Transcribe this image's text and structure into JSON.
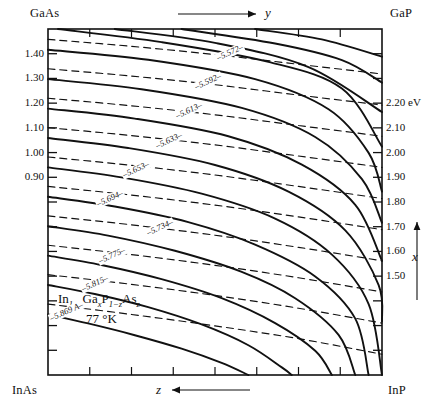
{
  "figure": {
    "title_compound": "In1-xGaxP1-zAsz",
    "temperature": "77 °K",
    "corners": {
      "top_left": "GaAs",
      "top_right": "GaP",
      "bottom_left": "InAs",
      "bottom_right": "InP"
    },
    "axes": {
      "top_variable": "y",
      "bottom_variable": "z",
      "right_variable": "x",
      "left_unit": "",
      "right_unit": "eV"
    },
    "formula_parts": {
      "in": "In",
      "sub1": "1−x",
      "ga": "Ga",
      "sub2": "x",
      "p": "P",
      "sub3": "1−z",
      "as": "As",
      "sub4": "z"
    }
  },
  "left_ticks": [
    "1.40",
    "1.30",
    "1.20",
    "1.10",
    "1.00",
    "0.90"
  ],
  "right_ticks": [
    "2.20 eV",
    "2.10",
    "2.00",
    "1.90",
    "1.80",
    "1.70",
    "1.60",
    "1.50"
  ],
  "lattice_labels": [
    "5.572",
    "5.592",
    "5.613",
    "5.633",
    "5.653",
    "5.694",
    "5.734",
    "5.775",
    "5.815",
    "5.869 A"
  ],
  "chart_data": {
    "type": "line",
    "xlabel": "z  (InAs → InP direction, bottom) / y (GaAs → GaP, top)",
    "ylabel": "x (composition, right axis) / bandgap energy (eV)",
    "xlim": [
      0,
      1
    ],
    "ylim": [
      0,
      1
    ],
    "grid": false,
    "legend": "none",
    "series": [
      {
        "name": "bandgap-0.90eV",
        "style": "solid",
        "label": "0.90",
        "points": [
          [
            0.0,
            0.175
          ],
          [
            0.12,
            0.149
          ],
          [
            0.26,
            0.115
          ],
          [
            0.4,
            0.076
          ],
          [
            0.52,
            0.035
          ],
          [
            0.6,
            0.0
          ]
        ]
      },
      {
        "name": "bandgap-1.00eV",
        "style": "solid",
        "label": "1.00",
        "points": [
          [
            0.0,
            0.26
          ],
          [
            0.14,
            0.234
          ],
          [
            0.3,
            0.196
          ],
          [
            0.46,
            0.146
          ],
          [
            0.6,
            0.086
          ],
          [
            0.7,
            0.022
          ],
          [
            0.73,
            0.0
          ]
        ]
      },
      {
        "name": "bandgap-1.10eV",
        "style": "solid",
        "label": "1.10",
        "points": [
          [
            0.0,
            0.345
          ],
          [
            0.16,
            0.318
          ],
          [
            0.34,
            0.277
          ],
          [
            0.52,
            0.222
          ],
          [
            0.68,
            0.15
          ],
          [
            0.8,
            0.07
          ],
          [
            0.85,
            0.0
          ]
        ]
      },
      {
        "name": "bandgap-1.20eV",
        "style": "solid",
        "label": "1.20",
        "points": [
          [
            0.0,
            0.43
          ],
          [
            0.18,
            0.403
          ],
          [
            0.38,
            0.359
          ],
          [
            0.58,
            0.298
          ],
          [
            0.74,
            0.222
          ],
          [
            0.87,
            0.116
          ],
          [
            0.92,
            0.0
          ]
        ]
      },
      {
        "name": "bandgap-1.30eV",
        "style": "solid",
        "label": "1.30",
        "points": [
          [
            0.0,
            0.515
          ],
          [
            0.2,
            0.487
          ],
          [
            0.42,
            0.442
          ],
          [
            0.62,
            0.377
          ],
          [
            0.8,
            0.285
          ],
          [
            0.92,
            0.163
          ],
          [
            0.96,
            0.0
          ]
        ]
      },
      {
        "name": "bandgap-1.40eV",
        "style": "solid",
        "label": "1.40",
        "points": [
          [
            0.0,
            0.6
          ],
          [
            0.22,
            0.571
          ],
          [
            0.46,
            0.524
          ],
          [
            0.68,
            0.452
          ],
          [
            0.85,
            0.348
          ],
          [
            0.96,
            0.205
          ],
          [
            1.0,
            0.0
          ]
        ]
      },
      {
        "name": "bandgap-1.50eV",
        "style": "solid",
        "label": "1.50",
        "points": [
          [
            0.0,
            0.685
          ],
          [
            0.24,
            0.656
          ],
          [
            0.5,
            0.607
          ],
          [
            0.72,
            0.53
          ],
          [
            0.89,
            0.418
          ],
          [
            0.99,
            0.26
          ],
          [
            1.0,
            0.155
          ]
        ]
      },
      {
        "name": "bandgap-1.60eV",
        "style": "solid",
        "label": "1.60",
        "points": [
          [
            0.0,
            0.77
          ],
          [
            0.26,
            0.741
          ],
          [
            0.54,
            0.69
          ],
          [
            0.76,
            0.608
          ],
          [
            0.92,
            0.492
          ],
          [
            1.0,
            0.33
          ]
        ]
      },
      {
        "name": "bandgap-1.70eV",
        "style": "solid",
        "label": "1.70",
        "points": [
          [
            0.0,
            0.855
          ],
          [
            0.28,
            0.826
          ],
          [
            0.58,
            0.772
          ],
          [
            0.8,
            0.688
          ],
          [
            0.94,
            0.566
          ],
          [
            1.0,
            0.44
          ]
        ]
      },
      {
        "name": "bandgap-1.80eV",
        "style": "solid",
        "label": "1.80",
        "points": [
          [
            0.0,
            0.94
          ],
          [
            0.3,
            0.911
          ],
          [
            0.62,
            0.855
          ],
          [
            0.84,
            0.768
          ],
          [
            0.96,
            0.642
          ],
          [
            1.0,
            0.53
          ]
        ]
      },
      {
        "name": "bandgap-1.90eV",
        "style": "solid",
        "label": "1.90",
        "points": [
          [
            0.03,
            1.0
          ],
          [
            0.34,
            0.962
          ],
          [
            0.66,
            0.905
          ],
          [
            0.88,
            0.828
          ],
          [
            1.0,
            0.66
          ]
        ]
      },
      {
        "name": "bandgap-2.00eV",
        "style": "solid",
        "label": "2.00",
        "points": [
          [
            0.2,
            1.0
          ],
          [
            0.5,
            0.96
          ],
          [
            0.78,
            0.89
          ],
          [
            1.0,
            0.76
          ]
        ]
      },
      {
        "name": "bandgap-2.10eV",
        "style": "solid",
        "label": "2.10",
        "points": [
          [
            0.4,
            1.0
          ],
          [
            0.68,
            0.958
          ],
          [
            0.88,
            0.91
          ],
          [
            1.0,
            0.845
          ]
        ]
      },
      {
        "name": "bandgap-2.20eV",
        "style": "solid",
        "label": "2.20 eV",
        "points": [
          [
            0.62,
            1.0
          ],
          [
            0.82,
            0.97
          ],
          [
            1.0,
            0.92
          ]
        ]
      },
      {
        "name": "lattice-5.869",
        "style": "dashed",
        "label": "5.869 A",
        "points": [
          [
            0.0,
            0.205
          ],
          [
            0.25,
            0.175
          ],
          [
            0.5,
            0.142
          ],
          [
            0.75,
            0.105
          ],
          [
            1.0,
            0.06
          ]
        ]
      },
      {
        "name": "lattice-5.815",
        "style": "dashed",
        "label": "5.815",
        "points": [
          [
            0.0,
            0.29
          ],
          [
            0.25,
            0.262
          ],
          [
            0.5,
            0.23
          ],
          [
            0.75,
            0.193
          ],
          [
            1.0,
            0.15
          ]
        ]
      },
      {
        "name": "lattice-5.775",
        "style": "dashed",
        "label": "5.775",
        "points": [
          [
            0.0,
            0.375
          ],
          [
            0.25,
            0.348
          ],
          [
            0.5,
            0.317
          ],
          [
            0.75,
            0.281
          ],
          [
            1.0,
            0.24
          ]
        ]
      },
      {
        "name": "lattice-5.734",
        "style": "dashed",
        "label": "5.734",
        "points": [
          [
            0.0,
            0.46
          ],
          [
            0.25,
            0.434
          ],
          [
            0.5,
            0.404
          ],
          [
            0.75,
            0.369
          ],
          [
            1.0,
            0.33
          ]
        ]
      },
      {
        "name": "lattice-5.694",
        "style": "dashed",
        "label": "5.694",
        "points": [
          [
            0.0,
            0.545
          ],
          [
            0.25,
            0.52
          ],
          [
            0.5,
            0.491
          ],
          [
            0.75,
            0.457
          ],
          [
            1.0,
            0.42
          ]
        ]
      },
      {
        "name": "lattice-5.653",
        "style": "dashed",
        "label": "5.653",
        "points": [
          [
            0.0,
            0.63
          ],
          [
            0.25,
            0.606
          ],
          [
            0.5,
            0.578
          ],
          [
            0.75,
            0.545
          ],
          [
            1.0,
            0.51
          ]
        ]
      },
      {
        "name": "lattice-5.633",
        "style": "dashed",
        "label": "5.633",
        "points": [
          [
            0.0,
            0.715
          ],
          [
            0.25,
            0.692
          ],
          [
            0.5,
            0.665
          ],
          [
            0.75,
            0.633
          ],
          [
            1.0,
            0.6
          ]
        ]
      },
      {
        "name": "lattice-5.613",
        "style": "dashed",
        "label": "5.613",
        "points": [
          [
            0.0,
            0.8
          ],
          [
            0.25,
            0.778
          ],
          [
            0.5,
            0.752
          ],
          [
            0.75,
            0.721
          ],
          [
            1.0,
            0.69
          ]
        ]
      },
      {
        "name": "lattice-5.592",
        "style": "dashed",
        "label": "5.592",
        "points": [
          [
            0.0,
            0.885
          ],
          [
            0.25,
            0.864
          ],
          [
            0.5,
            0.839
          ],
          [
            0.75,
            0.809
          ],
          [
            1.0,
            0.78
          ]
        ]
      },
      {
        "name": "lattice-5.572",
        "style": "dashed",
        "label": "5.572",
        "points": [
          [
            0.0,
            0.97
          ],
          [
            0.25,
            0.95
          ],
          [
            0.5,
            0.926
          ],
          [
            0.75,
            0.898
          ],
          [
            1.0,
            0.87
          ]
        ]
      }
    ]
  }
}
